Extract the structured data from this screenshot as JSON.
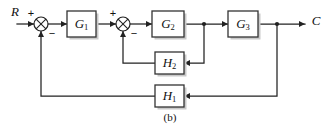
{
  "figure": {
    "caption": "(b)",
    "type": "control-system-block-diagram",
    "background_color": "#ffffff",
    "line_color": "#222222",
    "block_fill": "#ffffff",
    "block_stroke": "#333333",
    "block_shadow": "#c9c9c9"
  },
  "signals": {
    "input_label": "R",
    "output_label": "C"
  },
  "summing_junctions": [
    {
      "id": "sum-1",
      "name": "summing-junction-1",
      "cx": 41,
      "cy": 24,
      "r": 7,
      "plus_label": "+",
      "plus_x": 31,
      "plus_y": 14,
      "minus_label": "−",
      "minus_x": 52,
      "minus_y": 34
    },
    {
      "id": "sum-2",
      "name": "summing-junction-2",
      "cx": 123,
      "cy": 24,
      "r": 7,
      "plus_label": "+",
      "plus_x": 113,
      "plus_y": 14,
      "minus_label": "−",
      "minus_x": 134,
      "minus_y": 34
    }
  ],
  "blocks": [
    {
      "id": "g1",
      "name": "block-g1",
      "label": "G",
      "sub": "1",
      "x": 67,
      "y": 11,
      "w": 29,
      "h": 26
    },
    {
      "id": "g2",
      "name": "block-g2",
      "label": "G",
      "sub": "2",
      "x": 152,
      "y": 11,
      "w": 32,
      "h": 26
    },
    {
      "id": "g3",
      "name": "block-g3",
      "label": "G",
      "sub": "3",
      "x": 228,
      "y": 11,
      "w": 30,
      "h": 26
    },
    {
      "id": "h2",
      "name": "block-h2",
      "label": "H",
      "sub": "2",
      "x": 155,
      "y": 52,
      "w": 29,
      "h": 22
    },
    {
      "id": "h1",
      "name": "block-h1",
      "label": "H",
      "sub": "1",
      "x": 155,
      "y": 85,
      "w": 29,
      "h": 22
    }
  ],
  "junction_dots": [
    {
      "name": "takeoff-dot-g2-output",
      "cx": 204,
      "cy": 24,
      "r": 2.1
    },
    {
      "name": "takeoff-dot-output",
      "cx": 277,
      "cy": 24,
      "r": 2.1
    }
  ],
  "wires": [
    {
      "name": "wire-input-to-sum1",
      "d": "M 17 24 H 34"
    },
    {
      "name": "wire-sum1-to-g1",
      "d": "M 48 24 H 67"
    },
    {
      "name": "wire-g1-to-sum2",
      "d": "M 96 24 H 116"
    },
    {
      "name": "wire-sum2-to-g2",
      "d": "M 130 24 H 152"
    },
    {
      "name": "wire-g2-to-g3",
      "d": "M 184 24 H 228"
    },
    {
      "name": "wire-g3-to-output",
      "d": "M 258 24 H 305"
    },
    {
      "name": "wire-inner-feedback-takeoff",
      "d": "M 204 24 V 63 H 184"
    },
    {
      "name": "wire-h2-to-sum2",
      "d": "M 155 63 H 123 V 31"
    },
    {
      "name": "wire-outer-feedback-takeoff",
      "d": "M 277 24 V 96 H 184"
    },
    {
      "name": "wire-h1-to-sum1",
      "d": "M 155 96 H 41 V 31"
    }
  ],
  "arrowheads": [
    {
      "name": "arrowhead-into-sum1",
      "x": 34,
      "y": 24,
      "dir": "right"
    },
    {
      "name": "arrowhead-into-g1",
      "x": 67,
      "y": 24,
      "dir": "right"
    },
    {
      "name": "arrowhead-into-sum2",
      "x": 116,
      "y": 24,
      "dir": "right"
    },
    {
      "name": "arrowhead-into-g2",
      "x": 152,
      "y": 24,
      "dir": "right"
    },
    {
      "name": "arrowhead-into-g3",
      "x": 228,
      "y": 24,
      "dir": "right"
    },
    {
      "name": "arrowhead-into-output",
      "x": 305,
      "y": 24,
      "dir": "right"
    },
    {
      "name": "arrowhead-into-h2",
      "x": 184,
      "y": 63,
      "dir": "left"
    },
    {
      "name": "arrowhead-into-sum2-feedback",
      "x": 123,
      "y": 31,
      "dir": "up"
    },
    {
      "name": "arrowhead-into-h1",
      "x": 184,
      "y": 96,
      "dir": "left"
    },
    {
      "name": "arrowhead-into-sum1-feedback",
      "x": 41,
      "y": 31,
      "dir": "up"
    }
  ],
  "labels": {
    "input": {
      "name": "signal-label-r",
      "x": 15,
      "y": 13
    },
    "output": {
      "name": "signal-label-c",
      "x": 316,
      "y": 22
    },
    "caption": {
      "name": "figure-caption",
      "x": 170,
      "y": 118
    }
  }
}
